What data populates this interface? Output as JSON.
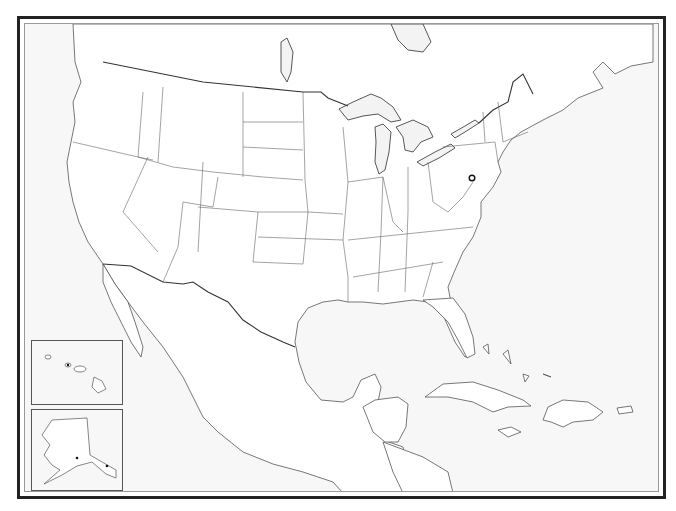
{
  "map": {
    "title": "",
    "type": "outline map",
    "region": "North America",
    "colors": {
      "frame": "#222222",
      "inner_rule": "#999999",
      "water": "#f7f7f7",
      "land": "#ffffff",
      "borders": "#666666",
      "international_border": "#333333"
    },
    "insets": [
      {
        "name": "Hawaii"
      },
      {
        "name": "Alaska"
      }
    ],
    "markers": [
      {
        "name": "capital-marker",
        "type": "star-in-circle"
      }
    ]
  }
}
